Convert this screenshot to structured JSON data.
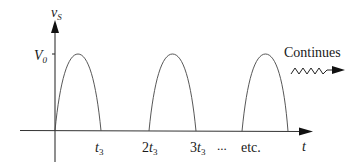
{
  "diagram": {
    "type": "periodic half-sine pulse waveform",
    "y_axis": {
      "label_main": "v",
      "label_sub": "S",
      "tick_label_main": "V",
      "tick_label_sub": "0"
    },
    "x_axis": {
      "label": "t"
    },
    "tick_labels": [
      {
        "main": "t",
        "sub": "3",
        "prefix": ""
      },
      {
        "main": "t",
        "sub": "3",
        "prefix": "2"
      },
      {
        "main": "t",
        "sub": "3",
        "prefix": "3"
      }
    ],
    "ellipsis": "...",
    "etc_label": "etc.",
    "continues_label": "Continues",
    "pulses": [
      {
        "start": 0,
        "end": "t3",
        "peak": "V0"
      },
      {
        "start": "2t3",
        "end": "3t3",
        "peak": "V0"
      },
      {
        "start": "etc.",
        "end": "",
        "peak": "V0"
      }
    ],
    "colors": {
      "line": "#333333",
      "text": "#1a1a1a",
      "background": "#ffffff"
    }
  }
}
